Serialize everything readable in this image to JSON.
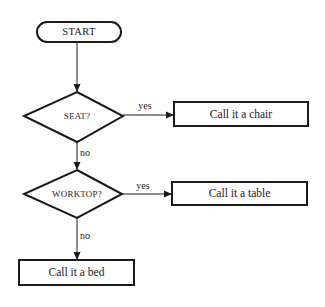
{
  "diagram": {
    "type": "flowchart",
    "colors": {
      "background": "#ffffff",
      "stroke": "#1a1a1a",
      "text": "#1a1a1a"
    },
    "nodes": {
      "start": {
        "label": "START",
        "shape": "terminal"
      },
      "seat": {
        "label": "SEAT?",
        "shape": "decision"
      },
      "worktop": {
        "label": "WORKTOP?",
        "shape": "decision"
      },
      "chair": {
        "label": "Call it a chair",
        "shape": "process"
      },
      "table": {
        "label": "Call it a table",
        "shape": "process"
      },
      "bed": {
        "label": "Call it a bed",
        "shape": "process"
      }
    },
    "edges": {
      "start_to_seat": {
        "label": ""
      },
      "seat_yes": {
        "label": "yes"
      },
      "seat_no": {
        "label": "no"
      },
      "worktop_yes": {
        "label": "yes"
      },
      "worktop_no": {
        "label": "no"
      }
    }
  }
}
